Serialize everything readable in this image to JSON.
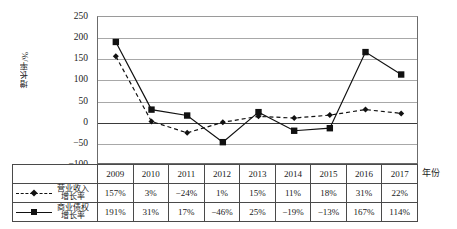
{
  "chart_data": {
    "type": "line",
    "title": "",
    "xlabel": "年份",
    "ylabel": "增长率/%",
    "categories": [
      "2009",
      "2010",
      "2011",
      "2012",
      "2013",
      "2014",
      "2015",
      "2016",
      "2017"
    ],
    "ylim": [
      -100,
      250
    ],
    "yticks": [
      250,
      200,
      150,
      100,
      50,
      0,
      -50,
      -100
    ],
    "ytick_labels": [
      "250",
      "200",
      "150",
      "100",
      "50",
      "0",
      "-50",
      "-100"
    ],
    "grid": true,
    "legend_position": "table-left",
    "series": [
      {
        "name": "营业收入增长率",
        "name_line1": "营业收入",
        "name_line2": "增长率",
        "marker": "diamond",
        "linestyle": "dashed",
        "color": "#111111",
        "values": [
          157,
          3,
          -24,
          1,
          15,
          11,
          18,
          31,
          22
        ],
        "labels": [
          "157%",
          "3%",
          "-24%",
          "1%",
          "15%",
          "11%",
          "18%",
          "31%",
          "22%"
        ]
      },
      {
        "name": "商业债权增长率",
        "name_line1": "商业债权",
        "name_line2": "增长率",
        "marker": "square",
        "linestyle": "solid",
        "color": "#111111",
        "values": [
          191,
          31,
          17,
          -46,
          25,
          -19,
          -13,
          167,
          114
        ],
        "labels": [
          "191%",
          "31%",
          "17%",
          "-46%",
          "25%",
          "-19%",
          "-13%",
          "167%",
          "114%"
        ]
      }
    ]
  },
  "axis": {
    "y_title": "增长率/%",
    "x_title": "年份"
  },
  "colors": {
    "gridline": "#a8a8a8",
    "zero_line": "#3a3a3a",
    "series": "#111111",
    "table_border": "#4a4a4a",
    "background": "#ffffff"
  }
}
